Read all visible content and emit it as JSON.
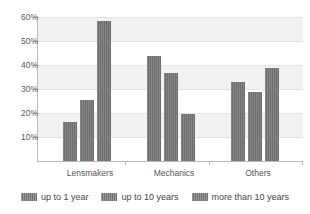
{
  "chart_data": {
    "type": "bar",
    "title": "",
    "xlabel": "",
    "ylabel": "",
    "categories": [
      "Lensmakers",
      "Mechanics",
      "Others"
    ],
    "series": [
      {
        "name": "up to 1 year",
        "values": [
          16.3,
          43.8,
          33.0
        ]
      },
      {
        "name": "up to 10 years",
        "values": [
          25.5,
          36.6,
          28.9
        ]
      },
      {
        "name": "more than 10 years",
        "values": [
          58.3,
          19.5,
          38.6
        ]
      }
    ],
    "ylim": [
      0,
      60
    ],
    "ytick_values": [
      60,
      50,
      40,
      30,
      20,
      10
    ],
    "ytick_labels": [
      "60%",
      "50%",
      "40%",
      "30%",
      "20%",
      "10%"
    ],
    "grid": true,
    "banded_background": true,
    "legend_position": "bottom",
    "bar_color": "#6e6e6e",
    "band_color": "#f2f2f2",
    "axis_color": "#b9b9b9"
  },
  "axis": {
    "ticks": [
      {
        "label": "60%"
      },
      {
        "label": "50%"
      },
      {
        "label": "40%"
      },
      {
        "label": "30%"
      },
      {
        "label": "20%"
      },
      {
        "label": "10%"
      }
    ]
  },
  "categories": [
    {
      "label": "Lensmakers"
    },
    {
      "label": "Mechanics"
    },
    {
      "label": "Others"
    }
  ],
  "legend": {
    "items": [
      {
        "label": "up to 1 year"
      },
      {
        "label": "up to 10 years"
      },
      {
        "label": "more than 10 years"
      }
    ]
  }
}
